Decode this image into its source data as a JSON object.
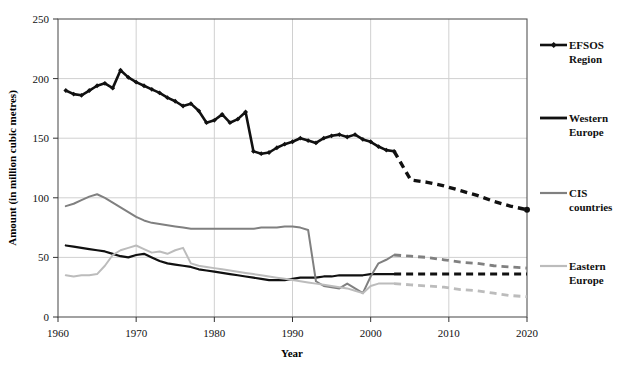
{
  "chart_data": {
    "type": "line",
    "title": "",
    "xlabel": "Year",
    "ylabel": "Amount (in million cubic metres)",
    "xlim": [
      1960,
      2020
    ],
    "ylim": [
      0,
      250
    ],
    "xticks": [
      "1960",
      "1970",
      "1980",
      "1990",
      "2000",
      "2010",
      "2020"
    ],
    "yticks": [
      "0",
      "50",
      "100",
      "150",
      "200",
      "250"
    ],
    "grid": "both",
    "legend_position": "right",
    "forecast_start_year": 2003,
    "series": [
      {
        "name": "EFSOS Region",
        "color": "#111111",
        "marker": "diamond",
        "x": [
          1961,
          1962,
          1963,
          1964,
          1965,
          1966,
          1967,
          1968,
          1969,
          1970,
          1971,
          1972,
          1973,
          1974,
          1975,
          1976,
          1977,
          1978,
          1979,
          1980,
          1981,
          1982,
          1983,
          1984,
          1985,
          1986,
          1987,
          1988,
          1989,
          1990,
          1991,
          1992,
          1993,
          1994,
          1995,
          1996,
          1997,
          1998,
          1999,
          2000,
          2001,
          2002,
          2003,
          2005,
          2008,
          2010,
          2012,
          2015,
          2018,
          2020
        ],
        "values": [
          190,
          187,
          186,
          190,
          194,
          196,
          192,
          207,
          201,
          197,
          194,
          191,
          188,
          184,
          181,
          177,
          179,
          173,
          163,
          165,
          170,
          163,
          166,
          172,
          139,
          137,
          138,
          142,
          145,
          147,
          150,
          148,
          146,
          150,
          152,
          153,
          151,
          153,
          149,
          147,
          143,
          140,
          139,
          136,
          118,
          111,
          116,
          110,
          90,
          72
        ],
        "history_values": [
          190,
          187,
          186,
          190,
          194,
          196,
          192,
          207,
          201,
          197,
          194,
          191,
          188,
          184,
          181,
          177,
          179,
          173,
          163,
          165,
          170,
          163,
          166,
          172,
          139,
          137,
          138,
          142,
          145,
          147,
          150,
          148,
          146,
          150,
          152,
          153,
          151,
          153,
          149,
          147,
          143,
          140,
          139
        ],
        "forecast_values": [
          115,
          113,
          110,
          106,
          102,
          97,
          93,
          90
        ]
      },
      {
        "name": "Western Europe",
        "color": "#111111",
        "marker": "none",
        "values": [
          60,
          59,
          58,
          57,
          56,
          55,
          53,
          51,
          50,
          52,
          53,
          50,
          47,
          45,
          44,
          43,
          42,
          40,
          39,
          38,
          37,
          36,
          35,
          34,
          33,
          32,
          31,
          31,
          31,
          32,
          33,
          33,
          33,
          34,
          34,
          35,
          35,
          35,
          35,
          36,
          36,
          36,
          36
        ],
        "forecast_values": [
          36,
          36,
          36,
          36,
          36,
          36,
          36,
          36
        ]
      },
      {
        "name": "CIS countries",
        "color": "#808080",
        "marker": "none",
        "values": [
          93,
          95,
          98,
          101,
          103,
          100,
          96,
          92,
          88,
          84,
          81,
          79,
          78,
          77,
          76,
          75,
          74,
          74,
          74,
          74,
          74,
          74,
          74,
          74,
          74,
          75,
          75,
          75,
          76,
          76,
          75,
          73,
          30,
          26,
          25,
          24,
          28,
          24,
          20,
          34,
          45,
          48,
          52
        ],
        "forecast_values": [
          51,
          50,
          48,
          46,
          45,
          43,
          42,
          41
        ]
      },
      {
        "name": "Eastern Europe",
        "color": "#bcbcbc",
        "marker": "none",
        "values": [
          35,
          34,
          35,
          35,
          36,
          43,
          52,
          56,
          58,
          60,
          57,
          54,
          55,
          53,
          56,
          58,
          45,
          43,
          42,
          41,
          40,
          39,
          38,
          37,
          36,
          35,
          34,
          33,
          32,
          31,
          30,
          29,
          28,
          27,
          26,
          25,
          24,
          22,
          20,
          26,
          28,
          28,
          28
        ],
        "forecast_values": [
          27,
          26,
          25,
          23,
          22,
          20,
          18,
          17
        ]
      }
    ]
  },
  "legend": {
    "items": [
      {
        "label_line1": "EFSOS",
        "label_line2": "Region"
      },
      {
        "label_line1": "Western",
        "label_line2": "Europe"
      },
      {
        "label_line1": "CIS",
        "label_line2": "countries"
      },
      {
        "label_line1": "Eastern",
        "label_line2": "Europe"
      }
    ]
  }
}
